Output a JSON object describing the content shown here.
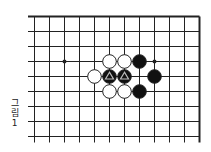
{
  "diagram": {
    "type": "go-board-diagram",
    "caption": [
      "그",
      "림",
      "1"
    ],
    "caption_text": "그림 1",
    "grid": {
      "columns": 12,
      "rows": 9,
      "origin_x": 34.5,
      "origin_y": 16.5,
      "spacing": 15,
      "line_left_extend": 6.5,
      "line_bottom_extend": 6,
      "top_edge": true,
      "right_edge": true
    },
    "star_points": [
      [
        2,
        3
      ],
      [
        8,
        3
      ]
    ],
    "stones": [
      {
        "col": 5,
        "row": 3,
        "color": "white"
      },
      {
        "col": 6,
        "row": 3,
        "color": "white"
      },
      {
        "col": 7,
        "row": 3,
        "color": "black"
      },
      {
        "col": 4,
        "row": 4,
        "color": "white"
      },
      {
        "col": 5,
        "row": 4,
        "color": "black",
        "mark": "triangle"
      },
      {
        "col": 6,
        "row": 4,
        "color": "black",
        "mark": "triangle"
      },
      {
        "col": 8,
        "row": 4,
        "color": "black"
      },
      {
        "col": 5,
        "row": 5,
        "color": "white"
      },
      {
        "col": 6,
        "row": 5,
        "color": "white"
      },
      {
        "col": 7,
        "row": 5,
        "color": "black"
      }
    ],
    "colors": {
      "line": "#222222",
      "black": "#111111",
      "white": "#ffffff",
      "mark": "#bbbbbb"
    }
  }
}
